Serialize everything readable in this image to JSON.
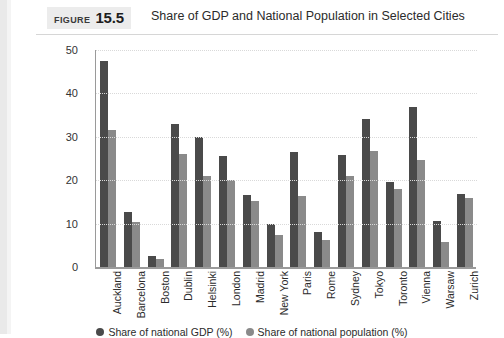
{
  "figure": {
    "label_word": "FIGURE",
    "number": "15.5",
    "title": "Share of GDP and National Population in Selected Cities"
  },
  "chart_data": {
    "type": "bar",
    "title": "Share of GDP and National Population in Selected Cities",
    "xlabel": "",
    "ylabel": "",
    "ylim": [
      0,
      50
    ],
    "yticks": [
      0,
      10,
      20,
      30,
      40,
      50
    ],
    "grid": true,
    "legend_position": "bottom",
    "categories": [
      "Auckland",
      "Barcelona",
      "Boston",
      "Dublin",
      "Helsinki",
      "London",
      "Madrid",
      "New York",
      "Paris",
      "Rome",
      "Sydney",
      "Tokyo",
      "Toronto",
      "Vienna",
      "Warsaw",
      "Zurich"
    ],
    "series": [
      {
        "name": "Share of national GDP (%)",
        "color": "#4a4a4a",
        "values": [
          47.5,
          12.7,
          2.5,
          33.0,
          30.0,
          25.5,
          16.5,
          9.8,
          26.5,
          8.0,
          25.8,
          34.0,
          19.5,
          36.8,
          10.5,
          16.8
        ]
      },
      {
        "name": "Share of national population (%)",
        "color": "#8a8a8a",
        "values": [
          31.5,
          10.3,
          1.8,
          26.0,
          21.0,
          20.0,
          15.3,
          7.3,
          16.3,
          6.2,
          21.0,
          26.8,
          18.0,
          24.7,
          5.8,
          15.8
        ]
      }
    ]
  }
}
